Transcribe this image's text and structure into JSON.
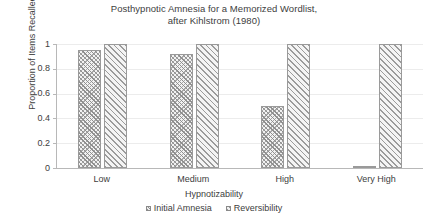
{
  "chart_data": {
    "type": "bar",
    "title": "Posthypnotic Amnesia for a Memorized Wordlist, after Kihlstrom (1980)",
    "title_line1": "Posthypnotic Amnesia for a Memorized Wordlist,",
    "title_line2": "after Kihlstrom (1980)",
    "xlabel": "Hypnotizability",
    "ylabel": "Proportion of Items Recalled",
    "categories": [
      "Low",
      "Medium",
      "High",
      "Very High"
    ],
    "series": [
      {
        "name": "Initial Amnesia",
        "values": [
          0.95,
          0.92,
          0.5,
          0.01
        ],
        "color": "#9a9a9a",
        "pattern": "crosshatch"
      },
      {
        "name": "Reversibility",
        "values": [
          1.0,
          1.0,
          1.0,
          1.0
        ],
        "color": "#9a9a9a",
        "pattern": "diagonal-hatch"
      }
    ],
    "ylim": [
      0,
      1
    ],
    "yticks": [
      "0",
      "0.2",
      "0.4",
      "0.6",
      "0.8",
      "1"
    ],
    "ytick_values": [
      0,
      0.2,
      0.4,
      0.6,
      0.8,
      1
    ],
    "grid": true,
    "grid_axis": "y",
    "grid_color": "#ececec",
    "legend_position": "bottom",
    "axis_color": "#b8b8b8",
    "background": "#ffffff"
  }
}
